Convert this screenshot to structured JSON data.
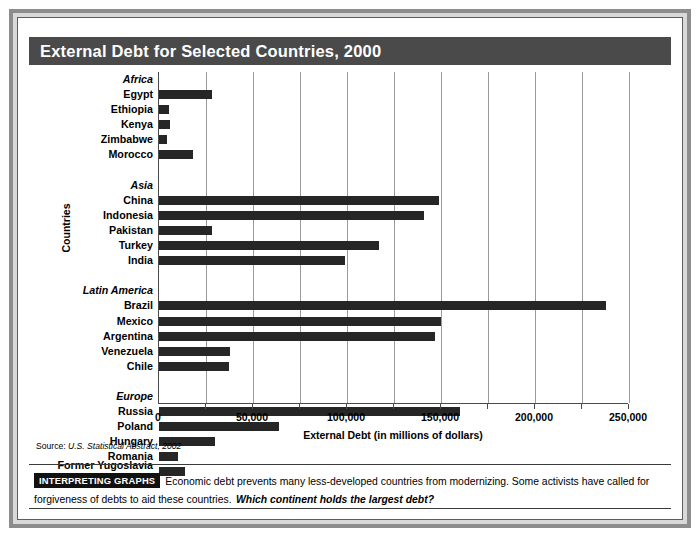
{
  "figure": {
    "title": "External Debt for Selected Countries, 2000",
    "source_label": "Source:",
    "source_title": "U.S. Statistical Abstract, 2002"
  },
  "footer": {
    "badge": "INTERPRETING GRAPHS",
    "text": "Economic debt prevents many less-developed countries from modernizing. Some activists have called for forgiveness of debts to aid these countries.",
    "question": "Which continent holds the largest debt?"
  },
  "colors": {
    "title_bar": "#4a4a4a",
    "bar": "#262626",
    "gridline": "#9a9a9a",
    "axis": "#4a4a4a",
    "frame_outer": "#8d8d8d",
    "frame_mid": "#d9d9d9",
    "badge_bg": "#111111"
  },
  "chart_data": {
    "type": "bar",
    "orientation": "horizontal",
    "title": "External Debt for Selected Countries, 2000",
    "xlabel": "External Debt (in millions of dollars)",
    "ylabel": "Countries",
    "xlim": [
      0,
      250000
    ],
    "xticks": [
      0,
      50000,
      100000,
      150000,
      200000,
      250000
    ],
    "xticklabels": [
      "0",
      "50,000",
      "100,000",
      "150,000",
      "200,000",
      "250,000"
    ],
    "minor_tick_interval": 25000,
    "grid": "vertical-minor-and-major",
    "legend": "none",
    "units": "millions of dollars",
    "groups": [
      {
        "name": "Africa",
        "categories": [
          "Egypt",
          "Ethiopia",
          "Kenya",
          "Zimbabwe",
          "Morocco"
        ],
        "values": [
          28000,
          5500,
          6000,
          4000,
          17900
        ]
      },
      {
        "name": "Asia",
        "categories": [
          "China",
          "Indonesia",
          "Pakistan",
          "Turkey",
          "India"
        ],
        "values": [
          149000,
          141000,
          28000,
          117000,
          99000
        ]
      },
      {
        "name": "Latin America",
        "categories": [
          "Brazil",
          "Mexico",
          "Argentina",
          "Venezuela",
          "Chile"
        ],
        "values": [
          238000,
          150000,
          147000,
          38000,
          37000
        ]
      },
      {
        "name": "Europe",
        "categories": [
          "Russia",
          "Poland",
          "Hungary",
          "Romania",
          "Former Yugoslavia"
        ],
        "values": [
          160000,
          64000,
          30000,
          10000,
          14000
        ]
      }
    ],
    "rows": [
      {
        "label": "Africa",
        "type": "group",
        "value": null
      },
      {
        "label": "Egypt",
        "type": "bar",
        "value": 28000
      },
      {
        "label": "Ethiopia",
        "type": "bar",
        "value": 5500
      },
      {
        "label": "Kenya",
        "type": "bar",
        "value": 6000
      },
      {
        "label": "Zimbabwe",
        "type": "bar",
        "value": 4000
      },
      {
        "label": "Morocco",
        "type": "bar",
        "value": 17900
      },
      {
        "label": "",
        "type": "spacer",
        "value": null
      },
      {
        "label": "Asia",
        "type": "group",
        "value": null
      },
      {
        "label": "China",
        "type": "bar",
        "value": 149000
      },
      {
        "label": "Indonesia",
        "type": "bar",
        "value": 141000
      },
      {
        "label": "Pakistan",
        "type": "bar",
        "value": 28000
      },
      {
        "label": "Turkey",
        "type": "bar",
        "value": 117000
      },
      {
        "label": "India",
        "type": "bar",
        "value": 99000
      },
      {
        "label": "",
        "type": "spacer",
        "value": null
      },
      {
        "label": "Latin America",
        "type": "group",
        "value": null
      },
      {
        "label": "Brazil",
        "type": "bar",
        "value": 238000
      },
      {
        "label": "Mexico",
        "type": "bar",
        "value": 150000
      },
      {
        "label": "Argentina",
        "type": "bar",
        "value": 147000
      },
      {
        "label": "Venezuela",
        "type": "bar",
        "value": 38000
      },
      {
        "label": "Chile",
        "type": "bar",
        "value": 37000
      },
      {
        "label": "",
        "type": "spacer",
        "value": null
      },
      {
        "label": "Europe",
        "type": "group",
        "value": null
      },
      {
        "label": "Russia",
        "type": "bar",
        "value": 160000
      },
      {
        "label": "Poland",
        "type": "bar",
        "value": 64000
      },
      {
        "label": "Hungary",
        "type": "bar",
        "value": 30000
      },
      {
        "label": "Romania",
        "type": "bar",
        "value": 10000
      },
      {
        "label": "Former Yugoslavia",
        "label_line2": "(Serbia, Montenegro)",
        "type": "bar",
        "value": 14000
      }
    ]
  }
}
